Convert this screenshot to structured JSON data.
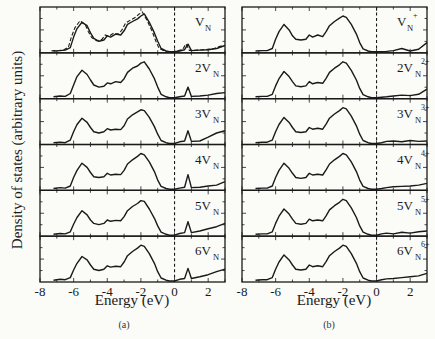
{
  "figure": {
    "ylabel": "Density of states (arbitrary units)",
    "xlabel": "Energy (eV)",
    "captions": [
      "(a)",
      "(b)"
    ],
    "xticks": [
      -8,
      -6,
      -4,
      -2,
      0,
      2
    ],
    "xlim": [
      -8,
      3
    ]
  },
  "chart_data": [
    {
      "type": "line",
      "title": "(a)",
      "xlabel": "Energy (eV)",
      "ylabel": "Density of states (arbitrary units)",
      "xlim": [
        -8,
        3
      ],
      "xticks": [
        -8,
        -6,
        -4,
        -2,
        0,
        2
      ],
      "fermi_level_dashed_x": 0,
      "stacked_panels": [
        {
          "label": "V_N",
          "label_main": "V",
          "label_sub": "N",
          "label_sup": "",
          "prefix": "",
          "has_dashed_reference": true,
          "x": [
            -7.2,
            -6.8,
            -6.5,
            -6.2,
            -6.0,
            -5.8,
            -5.5,
            -5.2,
            -5.0,
            -4.8,
            -4.5,
            -4.2,
            -4.0,
            -3.8,
            -3.5,
            -3.2,
            -3.0,
            -2.8,
            -2.5,
            -2.2,
            -2.0,
            -1.8,
            -1.5,
            -1.2,
            -1.0,
            -0.8,
            -0.5,
            -0.3,
            0,
            0.3,
            0.6,
            0.8,
            1.0,
            1.5,
            2.0,
            2.5,
            3.0
          ],
          "y": [
            0.02,
            0.03,
            0.04,
            0.1,
            0.35,
            0.55,
            0.7,
            0.62,
            0.45,
            0.32,
            0.25,
            0.28,
            0.38,
            0.35,
            0.42,
            0.4,
            0.5,
            0.65,
            0.72,
            0.78,
            0.85,
            0.9,
            0.7,
            0.45,
            0.25,
            0.08,
            0.02,
            0.0,
            0.0,
            0.02,
            0.05,
            0.18,
            0.03,
            0.04,
            0.05,
            0.08,
            0.15
          ]
        },
        {
          "label": "2V_N",
          "label_main": "V",
          "label_sub": "N",
          "label_sup": "",
          "prefix": "2",
          "x": [
            -7.2,
            -6.8,
            -6.5,
            -6.2,
            -6.0,
            -5.8,
            -5.5,
            -5.2,
            -5.0,
            -4.8,
            -4.5,
            -4.2,
            -4.0,
            -3.8,
            -3.5,
            -3.2,
            -3.0,
            -2.8,
            -2.5,
            -2.2,
            -2.0,
            -1.8,
            -1.5,
            -1.2,
            -1.0,
            -0.8,
            -0.5,
            -0.3,
            0,
            0.3,
            0.6,
            0.8,
            1.0,
            1.5,
            2.0,
            2.5,
            3.0
          ],
          "y": [
            0.02,
            0.04,
            0.03,
            0.1,
            0.3,
            0.5,
            0.65,
            0.55,
            0.42,
            0.3,
            0.25,
            0.27,
            0.35,
            0.33,
            0.38,
            0.36,
            0.45,
            0.6,
            0.7,
            0.75,
            0.82,
            0.85,
            0.68,
            0.45,
            0.25,
            0.08,
            0.02,
            0.0,
            0.0,
            0.02,
            0.04,
            0.25,
            0.03,
            0.04,
            0.06,
            0.1,
            0.12
          ]
        },
        {
          "label": "3V_N",
          "label_main": "V",
          "label_sub": "N",
          "label_sup": "",
          "prefix": "3",
          "x": [
            -7.2,
            -6.8,
            -6.5,
            -6.2,
            -6.0,
            -5.8,
            -5.5,
            -5.2,
            -5.0,
            -4.8,
            -4.5,
            -4.2,
            -4.0,
            -3.8,
            -3.5,
            -3.2,
            -3.0,
            -2.8,
            -2.5,
            -2.2,
            -2.0,
            -1.8,
            -1.5,
            -1.2,
            -1.0,
            -0.8,
            -0.5,
            -0.3,
            0,
            0.3,
            0.6,
            0.8,
            1.0,
            1.5,
            2.0,
            2.5,
            3.0
          ],
          "y": [
            0.02,
            0.03,
            0.02,
            0.08,
            0.28,
            0.45,
            0.6,
            0.5,
            0.38,
            0.28,
            0.25,
            0.28,
            0.35,
            0.32,
            0.34,
            0.33,
            0.42,
            0.58,
            0.68,
            0.75,
            0.8,
            0.78,
            0.62,
            0.4,
            0.22,
            0.07,
            0.02,
            0.0,
            0.0,
            0.04,
            0.06,
            0.3,
            0.05,
            0.06,
            0.15,
            0.25,
            0.3
          ]
        },
        {
          "label": "4V_N",
          "label_main": "V",
          "label_sub": "N",
          "label_sup": "",
          "prefix": "4",
          "x": [
            -7.2,
            -6.8,
            -6.5,
            -6.2,
            -6.0,
            -5.8,
            -5.5,
            -5.2,
            -5.0,
            -4.8,
            -4.5,
            -4.2,
            -4.0,
            -3.8,
            -3.5,
            -3.2,
            -3.0,
            -2.8,
            -2.5,
            -2.2,
            -2.0,
            -1.8,
            -1.5,
            -1.2,
            -1.0,
            -0.8,
            -0.5,
            -0.3,
            0,
            0.3,
            0.6,
            0.8,
            1.0,
            1.5,
            2.0,
            2.5,
            3.0
          ],
          "y": [
            0.02,
            0.04,
            0.03,
            0.08,
            0.28,
            0.45,
            0.62,
            0.52,
            0.4,
            0.3,
            0.28,
            0.3,
            0.38,
            0.34,
            0.36,
            0.35,
            0.45,
            0.6,
            0.7,
            0.78,
            0.85,
            0.82,
            0.65,
            0.42,
            0.22,
            0.07,
            0.02,
            0.0,
            0.0,
            0.03,
            0.05,
            0.35,
            0.04,
            0.05,
            0.08,
            0.1,
            0.18
          ]
        },
        {
          "label": "5V_N",
          "label_main": "V",
          "label_sub": "N",
          "label_sup": "",
          "prefix": "5",
          "x": [
            -7.2,
            -6.8,
            -6.5,
            -6.2,
            -6.0,
            -5.8,
            -5.5,
            -5.2,
            -5.0,
            -4.8,
            -4.5,
            -4.2,
            -4.0,
            -3.8,
            -3.5,
            -3.2,
            -3.0,
            -2.8,
            -2.5,
            -2.2,
            -2.0,
            -1.8,
            -1.5,
            -1.2,
            -1.0,
            -0.8,
            -0.5,
            -0.3,
            0,
            0.3,
            0.6,
            0.8,
            1.0,
            1.5,
            2.0,
            2.5,
            3.0
          ],
          "y": [
            0.02,
            0.04,
            0.03,
            0.08,
            0.26,
            0.42,
            0.58,
            0.48,
            0.36,
            0.28,
            0.25,
            0.28,
            0.36,
            0.33,
            0.35,
            0.34,
            0.44,
            0.58,
            0.68,
            0.75,
            0.82,
            0.8,
            0.62,
            0.4,
            0.22,
            0.07,
            0.02,
            0.0,
            0.0,
            0.04,
            0.06,
            0.32,
            0.06,
            0.1,
            0.15,
            0.2,
            0.28
          ]
        },
        {
          "label": "6V_N",
          "label_main": "V",
          "label_sub": "N",
          "label_sup": "",
          "prefix": "6",
          "x": [
            -7.2,
            -6.8,
            -6.5,
            -6.2,
            -6.0,
            -5.8,
            -5.5,
            -5.2,
            -5.0,
            -4.8,
            -4.5,
            -4.2,
            -4.0,
            -3.8,
            -3.5,
            -3.2,
            -3.0,
            -2.8,
            -2.5,
            -2.2,
            -2.0,
            -1.8,
            -1.5,
            -1.2,
            -1.0,
            -0.8,
            -0.5,
            -0.3,
            0,
            0.3,
            0.6,
            0.8,
            1.0,
            1.5,
            2.0,
            2.5,
            3.0
          ],
          "y": [
            0.02,
            0.04,
            0.03,
            0.08,
            0.26,
            0.42,
            0.58,
            0.5,
            0.38,
            0.28,
            0.25,
            0.28,
            0.36,
            0.33,
            0.35,
            0.34,
            0.45,
            0.6,
            0.7,
            0.78,
            0.85,
            0.82,
            0.65,
            0.42,
            0.22,
            0.07,
            0.02,
            0.0,
            0.0,
            0.04,
            0.06,
            0.3,
            0.06,
            0.1,
            0.15,
            0.22,
            0.28
          ]
        }
      ]
    },
    {
      "type": "line",
      "title": "(b)",
      "xlabel": "Energy (eV)",
      "ylabel": "Density of states (arbitrary units)",
      "xlim": [
        -8,
        3
      ],
      "xticks": [
        -8,
        -6,
        -4,
        -2,
        0,
        2
      ],
      "fermi_level_dashed_x": 0,
      "stacked_panels": [
        {
          "label": "V_N^+",
          "label_main": "V",
          "label_sub": "N",
          "label_sup": "+",
          "prefix": "",
          "x": [
            -7.2,
            -6.8,
            -6.5,
            -6.2,
            -6.0,
            -5.8,
            -5.5,
            -5.2,
            -5.0,
            -4.8,
            -4.5,
            -4.2,
            -4.0,
            -3.8,
            -3.5,
            -3.2,
            -3.0,
            -2.8,
            -2.5,
            -2.2,
            -2.0,
            -1.8,
            -1.5,
            -1.2,
            -1.0,
            -0.8,
            -0.5,
            -0.3,
            0,
            0.3,
            0.6,
            1.0,
            1.5,
            2.0,
            2.5,
            3.0
          ],
          "y": [
            0.02,
            0.03,
            0.03,
            0.08,
            0.3,
            0.48,
            0.65,
            0.52,
            0.38,
            0.3,
            0.28,
            0.3,
            0.4,
            0.35,
            0.4,
            0.36,
            0.48,
            0.62,
            0.72,
            0.8,
            0.85,
            0.82,
            0.65,
            0.42,
            0.22,
            0.07,
            0.02,
            0.0,
            0.0,
            0.0,
            0.01,
            0.03,
            0.08,
            0.02,
            0.06,
            0.22
          ]
        },
        {
          "label": "2V_N^2+",
          "label_main": "V",
          "label_sub": "N",
          "label_sup": "2+",
          "prefix": "2",
          "x": [
            -7.2,
            -6.8,
            -6.5,
            -6.2,
            -6.0,
            -5.8,
            -5.5,
            -5.2,
            -5.0,
            -4.8,
            -4.5,
            -4.2,
            -4.0,
            -3.8,
            -3.5,
            -3.2,
            -3.0,
            -2.8,
            -2.5,
            -2.2,
            -2.0,
            -1.8,
            -1.5,
            -1.2,
            -1.0,
            -0.8,
            -0.5,
            -0.3,
            0,
            0.3,
            0.6,
            1.0,
            1.5,
            2.0,
            2.5,
            3.0
          ],
          "y": [
            0.02,
            0.03,
            0.03,
            0.08,
            0.28,
            0.45,
            0.62,
            0.5,
            0.38,
            0.28,
            0.26,
            0.28,
            0.38,
            0.33,
            0.36,
            0.34,
            0.46,
            0.6,
            0.7,
            0.78,
            0.85,
            0.82,
            0.65,
            0.42,
            0.22,
            0.07,
            0.02,
            0.0,
            0.0,
            0.01,
            0.02,
            0.04,
            0.06,
            0.05,
            0.08,
            0.2
          ]
        },
        {
          "label": "3V_N^3+",
          "label_main": "V",
          "label_sub": "N",
          "label_sup": "3+",
          "prefix": "3",
          "x": [
            -7.2,
            -6.8,
            -6.5,
            -6.2,
            -6.0,
            -5.8,
            -5.5,
            -5.2,
            -5.0,
            -4.8,
            -4.5,
            -4.2,
            -4.0,
            -3.8,
            -3.5,
            -3.2,
            -3.0,
            -2.8,
            -2.5,
            -2.2,
            -2.0,
            -1.8,
            -1.5,
            -1.2,
            -1.0,
            -0.8,
            -0.5,
            -0.3,
            0,
            0.3,
            0.6,
            1.0,
            1.5,
            2.0,
            2.5,
            3.0
          ],
          "y": [
            0.02,
            0.03,
            0.03,
            0.08,
            0.28,
            0.45,
            0.62,
            0.5,
            0.38,
            0.28,
            0.26,
            0.28,
            0.38,
            0.34,
            0.36,
            0.34,
            0.46,
            0.6,
            0.7,
            0.78,
            0.85,
            0.82,
            0.65,
            0.42,
            0.22,
            0.07,
            0.02,
            0.0,
            0.0,
            0.02,
            0.05,
            0.06,
            0.04,
            0.07,
            0.05,
            0.06
          ]
        },
        {
          "label": "4V_N^4+",
          "label_main": "V",
          "label_sub": "N",
          "label_sup": "4+",
          "prefix": "4",
          "x": [
            -7.2,
            -6.8,
            -6.5,
            -6.2,
            -6.0,
            -5.8,
            -5.5,
            -5.2,
            -5.0,
            -4.8,
            -4.5,
            -4.2,
            -4.0,
            -3.8,
            -3.5,
            -3.2,
            -3.0,
            -2.8,
            -2.5,
            -2.2,
            -2.0,
            -1.8,
            -1.5,
            -1.2,
            -1.0,
            -0.8,
            -0.5,
            -0.3,
            0,
            0.3,
            0.6,
            1.0,
            1.5,
            2.0,
            2.5,
            3.0
          ],
          "y": [
            0.02,
            0.03,
            0.03,
            0.08,
            0.28,
            0.45,
            0.62,
            0.5,
            0.38,
            0.28,
            0.26,
            0.28,
            0.38,
            0.34,
            0.36,
            0.34,
            0.46,
            0.6,
            0.7,
            0.78,
            0.85,
            0.82,
            0.65,
            0.42,
            0.22,
            0.07,
            0.02,
            0.0,
            0.0,
            0.02,
            0.04,
            0.06,
            0.07,
            0.08,
            0.1,
            0.14
          ]
        },
        {
          "label": "5V_N^5+",
          "label_main": "V",
          "label_sub": "N",
          "label_sup": "5+",
          "prefix": "5",
          "x": [
            -7.2,
            -6.8,
            -6.5,
            -6.2,
            -6.0,
            -5.8,
            -5.5,
            -5.2,
            -5.0,
            -4.8,
            -4.5,
            -4.2,
            -4.0,
            -3.8,
            -3.5,
            -3.2,
            -3.0,
            -2.8,
            -2.5,
            -2.2,
            -2.0,
            -1.8,
            -1.5,
            -1.2,
            -1.0,
            -0.8,
            -0.5,
            -0.3,
            0,
            0.3,
            0.6,
            1.0,
            1.5,
            2.0,
            2.5,
            3.0
          ],
          "y": [
            0.02,
            0.03,
            0.03,
            0.08,
            0.28,
            0.45,
            0.62,
            0.5,
            0.38,
            0.28,
            0.26,
            0.28,
            0.38,
            0.34,
            0.36,
            0.34,
            0.46,
            0.6,
            0.7,
            0.78,
            0.85,
            0.82,
            0.65,
            0.42,
            0.22,
            0.07,
            0.02,
            0.0,
            0.0,
            0.03,
            0.05,
            0.03,
            0.07,
            0.05,
            0.08,
            0.1
          ]
        },
        {
          "label": "6V_N^6+",
          "label_main": "V",
          "label_sub": "N",
          "label_sup": "6+",
          "prefix": "6",
          "x": [
            -7.2,
            -6.8,
            -6.5,
            -6.2,
            -6.0,
            -5.8,
            -5.5,
            -5.2,
            -5.0,
            -4.8,
            -4.5,
            -4.2,
            -4.0,
            -3.8,
            -3.5,
            -3.2,
            -3.0,
            -2.8,
            -2.5,
            -2.2,
            -2.0,
            -1.8,
            -1.5,
            -1.2,
            -1.0,
            -0.8,
            -0.5,
            -0.3,
            0,
            0.3,
            0.6,
            1.0,
            1.5,
            2.0,
            2.5,
            3.0
          ],
          "y": [
            0.02,
            0.03,
            0.03,
            0.08,
            0.28,
            0.45,
            0.62,
            0.5,
            0.38,
            0.28,
            0.26,
            0.28,
            0.38,
            0.34,
            0.36,
            0.34,
            0.46,
            0.6,
            0.7,
            0.78,
            0.85,
            0.82,
            0.65,
            0.42,
            0.22,
            0.07,
            0.02,
            0.0,
            0.0,
            0.03,
            0.05,
            0.06,
            0.08,
            0.1,
            0.12,
            0.18
          ]
        }
      ]
    }
  ]
}
